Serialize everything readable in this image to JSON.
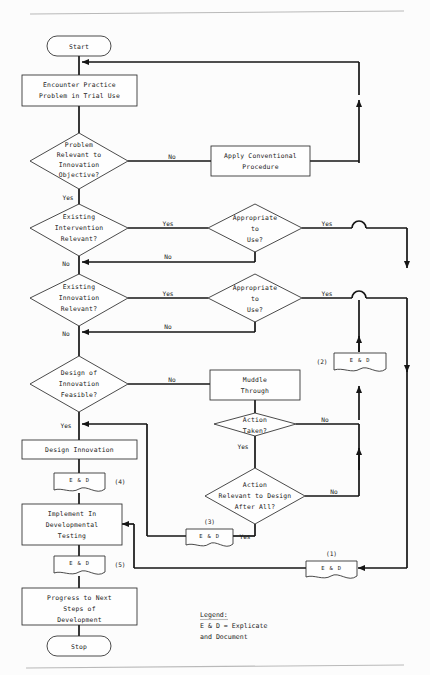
{
  "page": {
    "rule_color": "#b9b9b9",
    "line_color": "#151515",
    "shape_fill": "#fefefe",
    "shape_stroke": "#2b2b2b"
  },
  "nodes": {
    "start": {
      "label": "Start",
      "shape": "terminator"
    },
    "stop": {
      "label": "Stop",
      "shape": "terminator"
    },
    "encounter": {
      "line1": "Encounter Practice",
      "line2": "Problem in Trial Use",
      "shape": "process"
    },
    "apply_conventional": {
      "line1": "Apply Conventional",
      "line2": "Procedure",
      "shape": "process"
    },
    "muddle": {
      "line1": "Muddle",
      "line2": "Through",
      "shape": "process"
    },
    "design_innovation": {
      "line1": "Design Innovation",
      "shape": "process"
    },
    "implement": {
      "line1": "Implement In",
      "line2": "Developmental",
      "line3": "Testing",
      "shape": "process"
    },
    "progress": {
      "line1": "Progress to Next",
      "line2": "Steps of",
      "line3": "Development",
      "shape": "process"
    },
    "problem_relevant": {
      "line1": "Problem",
      "line2": "Relevant to",
      "line3": "Innovation",
      "line4": "Objective?",
      "shape": "decision"
    },
    "existing_intervention": {
      "line1": "Existing",
      "line2": "Intervention",
      "line3": "Relevant?",
      "shape": "decision"
    },
    "existing_innovation": {
      "line1": "Existing",
      "line2": "Innovation",
      "line3": "Relevant?",
      "shape": "decision"
    },
    "design_feasible": {
      "line1": "Design of",
      "line2": "Innovation",
      "line3": "Feasible?",
      "shape": "decision"
    },
    "appropriate_1": {
      "line1": "Appropriate",
      "line2": "to",
      "line3": "Use?",
      "shape": "decision"
    },
    "appropriate_2": {
      "line1": "Appropriate",
      "line2": "to",
      "line3": "Use?",
      "shape": "decision"
    },
    "action_taken": {
      "line1": "Action",
      "line2": "Taken?",
      "shape": "decision"
    },
    "action_relevant": {
      "line1": "Action",
      "line2": "Relevant to Design",
      "line3": "After All?",
      "shape": "decision"
    }
  },
  "ed_nodes": [
    {
      "id": "ed1",
      "label": "E & D",
      "ref": "(1)",
      "ref_position": "above"
    },
    {
      "id": "ed2",
      "label": "E & D",
      "ref": "(2)",
      "ref_position": "left"
    },
    {
      "id": "ed3",
      "label": "E & D",
      "ref": "(3)",
      "ref_position": "above"
    },
    {
      "id": "ed4",
      "label": "E & D",
      "ref": "(4)",
      "ref_position": "right"
    },
    {
      "id": "ed5",
      "label": "E & D",
      "ref": "(5)",
      "ref_position": "right"
    }
  ],
  "edge_labels": {
    "problem_relevant_no": "No",
    "problem_relevant_yes": "Yes",
    "existing_intervention_yes": "Yes",
    "existing_intervention_no": "No",
    "appropriate_1_yes": "Yes",
    "appropriate_1_no": "No",
    "existing_innovation_yes": "Yes",
    "existing_innovation_no": "No",
    "appropriate_2_yes": "Yes",
    "appropriate_2_no": "No",
    "design_feasible_no": "No",
    "design_feasible_yes": "Yes",
    "action_taken_no": "No",
    "action_taken_yes": "Yes",
    "action_relevant_no": "No",
    "action_relevant_yes": "Yes"
  },
  "legend": {
    "heading": "Legend:",
    "line1": "E & D = Explicate",
    "line2": "and Document"
  }
}
